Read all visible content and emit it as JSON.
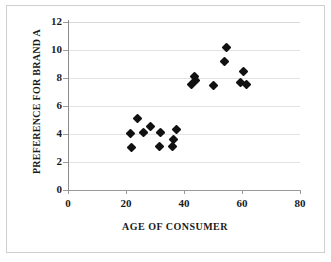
{
  "chart_data": {
    "type": "scatter",
    "title": "",
    "xlabel": "AGE OF CONSUMER",
    "ylabel": "PREFERENCE FOR BRAND A",
    "xlim": [
      0,
      80
    ],
    "ylim": [
      0,
      12
    ],
    "xticks": [
      0,
      20,
      40,
      60,
      80
    ],
    "yticks": [
      0,
      2,
      4,
      6,
      8,
      10,
      12
    ],
    "xtick_labels": [
      "0",
      "20",
      "40",
      "60",
      "80"
    ],
    "ytick_labels": [
      "0",
      "2",
      "4",
      "6",
      "8",
      "10",
      "12"
    ],
    "grid": "horizontal",
    "legend": "none",
    "marker": "filled-diamond",
    "marker_color": "#111111",
    "series": [
      {
        "name": "Consumers",
        "points": [
          {
            "x": 21.5,
            "y": 4.05
          },
          {
            "x": 22.0,
            "y": 3.05
          },
          {
            "x": 24.0,
            "y": 5.1
          },
          {
            "x": 26.0,
            "y": 4.1
          },
          {
            "x": 28.5,
            "y": 4.55
          },
          {
            "x": 31.5,
            "y": 3.1
          },
          {
            "x": 32.0,
            "y": 4.1
          },
          {
            "x": 36.0,
            "y": 3.1
          },
          {
            "x": 36.5,
            "y": 3.6
          },
          {
            "x": 37.5,
            "y": 4.3
          },
          {
            "x": 42.5,
            "y": 7.55
          },
          {
            "x": 43.5,
            "y": 8.1
          },
          {
            "x": 44.0,
            "y": 7.85
          },
          {
            "x": 50.0,
            "y": 7.45
          },
          {
            "x": 54.0,
            "y": 9.15
          },
          {
            "x": 54.5,
            "y": 10.15
          },
          {
            "x": 59.5,
            "y": 7.65
          },
          {
            "x": 60.5,
            "y": 8.45
          },
          {
            "x": 61.5,
            "y": 7.55
          }
        ]
      }
    ]
  },
  "axes": {
    "y_title": "PREFERENCE FOR BRAND A",
    "x_title": "AGE OF CONSUMER"
  }
}
